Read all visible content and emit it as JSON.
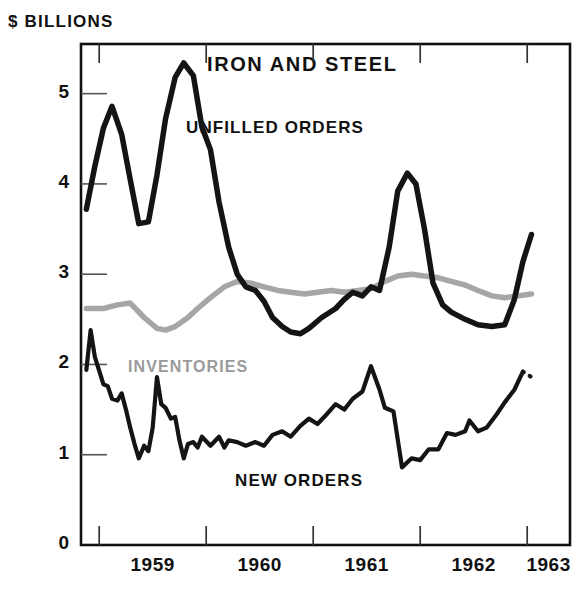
{
  "chart_data": {
    "type": "line",
    "title": "IRON AND STEEL",
    "ylabel": "$ BILLIONS",
    "xlabel": "",
    "ylim": [
      0,
      5.55
    ],
    "yticks": [
      0,
      1,
      2,
      3,
      4,
      5
    ],
    "ytick_labels": [
      "0",
      "1",
      "2",
      "3",
      "4",
      "5"
    ],
    "xlim": [
      1958.83,
      1963.4
    ],
    "xticks": [
      1959,
      1960,
      1961,
      1962,
      1963
    ],
    "xtick_labels": [
      "1959",
      "1960",
      "1961",
      "1962",
      "1963"
    ],
    "xtick_label_positions": [
      1959.5,
      1960.5,
      1961.5,
      1962.5,
      1963.2
    ],
    "grid": false,
    "legend": "inline-annotations",
    "series": [
      {
        "name": "UNFILLED ORDERS",
        "color": "#141414",
        "width": 5.5,
        "label_x": 186,
        "label_y": 118,
        "points": [
          [
            1958.88,
            3.72
          ],
          [
            1958.96,
            4.2
          ],
          [
            1959.04,
            4.62
          ],
          [
            1959.12,
            4.86
          ],
          [
            1959.21,
            4.55
          ],
          [
            1959.29,
            4.05
          ],
          [
            1959.37,
            3.56
          ],
          [
            1959.46,
            3.58
          ],
          [
            1959.54,
            4.1
          ],
          [
            1959.62,
            4.72
          ],
          [
            1959.71,
            5.18
          ],
          [
            1959.79,
            5.34
          ],
          [
            1959.88,
            5.2
          ],
          [
            1959.96,
            4.63
          ],
          [
            1960.04,
            4.38
          ],
          [
            1960.12,
            3.8
          ],
          [
            1960.21,
            3.3
          ],
          [
            1960.29,
            3.0
          ],
          [
            1960.37,
            2.86
          ],
          [
            1960.46,
            2.82
          ],
          [
            1960.54,
            2.7
          ],
          [
            1960.62,
            2.52
          ],
          [
            1960.71,
            2.42
          ],
          [
            1960.79,
            2.36
          ],
          [
            1960.88,
            2.34
          ],
          [
            1960.96,
            2.4
          ],
          [
            1961.08,
            2.52
          ],
          [
            1961.21,
            2.62
          ],
          [
            1961.29,
            2.72
          ],
          [
            1961.37,
            2.8
          ],
          [
            1961.46,
            2.76
          ],
          [
            1961.54,
            2.86
          ],
          [
            1961.62,
            2.82
          ],
          [
            1961.71,
            3.3
          ],
          [
            1961.79,
            3.92
          ],
          [
            1961.88,
            4.12
          ],
          [
            1961.96,
            4.0
          ],
          [
            1962.04,
            3.5
          ],
          [
            1962.12,
            2.9
          ],
          [
            1962.21,
            2.66
          ],
          [
            1962.29,
            2.58
          ],
          [
            1962.42,
            2.5
          ],
          [
            1962.54,
            2.44
          ],
          [
            1962.67,
            2.42
          ],
          [
            1962.79,
            2.44
          ],
          [
            1962.88,
            2.72
          ],
          [
            1962.96,
            3.14
          ],
          [
            1963.04,
            3.44
          ]
        ]
      },
      {
        "name": "INVENTORIES",
        "color": "#a6a6a6",
        "width": 5.5,
        "label_x": 128,
        "label_y": 358,
        "points": [
          [
            1958.88,
            2.62
          ],
          [
            1959.04,
            2.62
          ],
          [
            1959.17,
            2.66
          ],
          [
            1959.29,
            2.68
          ],
          [
            1959.42,
            2.52
          ],
          [
            1959.54,
            2.4
          ],
          [
            1959.62,
            2.38
          ],
          [
            1959.71,
            2.42
          ],
          [
            1959.83,
            2.52
          ],
          [
            1959.92,
            2.62
          ],
          [
            1960.04,
            2.74
          ],
          [
            1960.17,
            2.86
          ],
          [
            1960.29,
            2.92
          ],
          [
            1960.42,
            2.9
          ],
          [
            1960.54,
            2.86
          ],
          [
            1960.67,
            2.82
          ],
          [
            1960.79,
            2.8
          ],
          [
            1960.92,
            2.78
          ],
          [
            1961.04,
            2.8
          ],
          [
            1961.17,
            2.82
          ],
          [
            1961.29,
            2.8
          ],
          [
            1961.42,
            2.82
          ],
          [
            1961.54,
            2.84
          ],
          [
            1961.67,
            2.92
          ],
          [
            1961.79,
            2.98
          ],
          [
            1961.92,
            3.0
          ],
          [
            1962.04,
            2.98
          ],
          [
            1962.17,
            2.96
          ],
          [
            1962.29,
            2.92
          ],
          [
            1962.42,
            2.88
          ],
          [
            1962.54,
            2.82
          ],
          [
            1962.67,
            2.76
          ],
          [
            1962.79,
            2.74
          ],
          [
            1962.92,
            2.76
          ],
          [
            1963.04,
            2.78
          ]
        ]
      },
      {
        "name": "NEW ORDERS",
        "color": "#141414",
        "width": 4.2,
        "label_x": 235,
        "label_y": 471,
        "points": [
          [
            1958.88,
            1.94
          ],
          [
            1958.92,
            2.38
          ],
          [
            1958.96,
            2.08
          ],
          [
            1959.04,
            1.78
          ],
          [
            1959.08,
            1.76
          ],
          [
            1959.12,
            1.62
          ],
          [
            1959.17,
            1.6
          ],
          [
            1959.21,
            1.68
          ],
          [
            1959.25,
            1.5
          ],
          [
            1959.29,
            1.3
          ],
          [
            1959.33,
            1.12
          ],
          [
            1959.37,
            0.96
          ],
          [
            1959.42,
            1.1
          ],
          [
            1959.46,
            1.04
          ],
          [
            1959.5,
            1.3
          ],
          [
            1959.54,
            1.86
          ],
          [
            1959.58,
            1.56
          ],
          [
            1959.62,
            1.52
          ],
          [
            1959.67,
            1.4
          ],
          [
            1959.71,
            1.42
          ],
          [
            1959.75,
            1.16
          ],
          [
            1959.79,
            0.96
          ],
          [
            1959.83,
            1.12
          ],
          [
            1959.88,
            1.14
          ],
          [
            1959.92,
            1.08
          ],
          [
            1959.96,
            1.2
          ],
          [
            1960.04,
            1.1
          ],
          [
            1960.12,
            1.2
          ],
          [
            1960.17,
            1.08
          ],
          [
            1960.21,
            1.16
          ],
          [
            1960.29,
            1.14
          ],
          [
            1960.37,
            1.1
          ],
          [
            1960.46,
            1.14
          ],
          [
            1960.54,
            1.1
          ],
          [
            1960.62,
            1.22
          ],
          [
            1960.71,
            1.26
          ],
          [
            1960.79,
            1.2
          ],
          [
            1960.88,
            1.32
          ],
          [
            1960.96,
            1.4
          ],
          [
            1961.04,
            1.34
          ],
          [
            1961.12,
            1.44
          ],
          [
            1961.21,
            1.56
          ],
          [
            1961.29,
            1.5
          ],
          [
            1961.37,
            1.62
          ],
          [
            1961.46,
            1.7
          ],
          [
            1961.54,
            1.98
          ],
          [
            1961.62,
            1.72
          ],
          [
            1961.67,
            1.52
          ],
          [
            1961.75,
            1.48
          ],
          [
            1961.83,
            0.86
          ],
          [
            1961.92,
            0.96
          ],
          [
            1962.0,
            0.94
          ],
          [
            1962.08,
            1.06
          ],
          [
            1962.17,
            1.06
          ],
          [
            1962.25,
            1.24
          ],
          [
            1962.33,
            1.22
          ],
          [
            1962.42,
            1.26
          ],
          [
            1962.46,
            1.38
          ],
          [
            1962.54,
            1.26
          ],
          [
            1962.62,
            1.3
          ],
          [
            1962.71,
            1.44
          ],
          [
            1962.79,
            1.58
          ],
          [
            1962.88,
            1.72
          ],
          [
            1962.96,
            1.92
          ]
        ],
        "dotted_tail": [
          [
            1962.96,
            1.92
          ],
          [
            1963.04,
            1.86
          ]
        ]
      }
    ]
  },
  "axes": {
    "unit_label": "$ BILLIONS",
    "title": "IRON AND STEEL"
  },
  "labels": {
    "unfilled_orders": "UNFILLED ORDERS",
    "inventories": "INVENTORIES",
    "new_orders": "NEW ORDERS"
  },
  "colors": {
    "frame": "#111111",
    "unfilled_orders": "#141414",
    "inventories": "#a6a6a6",
    "new_orders": "#141414",
    "background": "#ffffff"
  }
}
